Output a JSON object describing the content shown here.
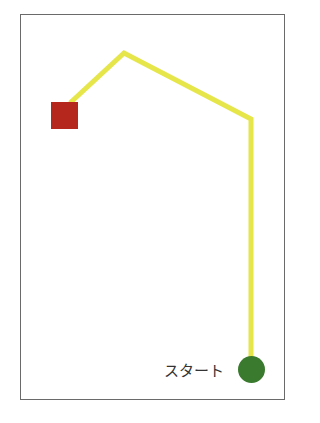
{
  "diagram": {
    "start_label": "スタート",
    "colors": {
      "frame": "#6a6a6a",
      "path": "#e6e64a",
      "goal": "#b5261c",
      "start": "#3a7a2e"
    },
    "path_points": [
      [
        70,
        103
      ],
      [
        124,
        53
      ],
      [
        251,
        119
      ],
      [
        251,
        360
      ]
    ]
  }
}
